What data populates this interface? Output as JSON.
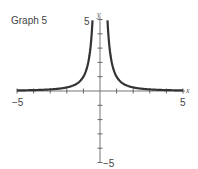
{
  "title": "Graph 5",
  "chart_data": {
    "type": "line",
    "title": "Graph 5",
    "xlabel": "x",
    "ylabel": "y",
    "xlim": [
      -5,
      5
    ],
    "ylim": [
      -5,
      5
    ],
    "x_tick_labels": [
      "-5",
      "5"
    ],
    "y_tick_labels": [
      "5",
      "-5"
    ],
    "x_ticks": [
      -5,
      -4,
      -3,
      -2,
      -1,
      0,
      1,
      2,
      3,
      4,
      5
    ],
    "y_ticks": [
      -5,
      -4,
      -3,
      -2,
      -1,
      0,
      1,
      2,
      3,
      4,
      5
    ],
    "grid": false,
    "series": [
      {
        "name": "y = 1/x^2",
        "description": "Symmetric curve with vertical asymptote at x=0, approaching y=0 as |x| grows",
        "x": [
          -5,
          -4,
          -3,
          -2,
          -1.5,
          -1,
          -0.7,
          -0.5,
          -0.45,
          0.45,
          0.5,
          0.7,
          1,
          1.5,
          2,
          3,
          4,
          5
        ],
        "y": [
          0.04,
          0.06,
          0.11,
          0.25,
          0.44,
          1,
          2.04,
          4,
          4.94,
          4.94,
          4,
          2.04,
          1,
          0.44,
          0.25,
          0.11,
          0.06,
          0.04
        ]
      }
    ]
  },
  "axis": {
    "x_label": "x",
    "y_label": "y",
    "x_min_label": "−5",
    "x_max_label": "5",
    "y_max_label": "5",
    "y_min_label": "−5"
  }
}
